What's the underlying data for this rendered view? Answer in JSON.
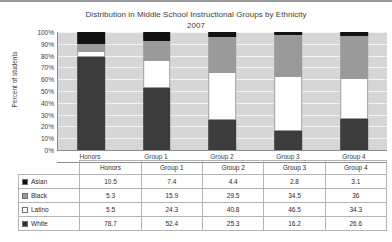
{
  "chart_data": {
    "type": "bar",
    "subtype": "stacked-percent",
    "title": "Distribution in Middle School Instructional Groups by Ethnicity",
    "subtitle": "2007",
    "xlabel": "",
    "ylabel": "Percent of students",
    "ylim": [
      0,
      100
    ],
    "ytick_labels": [
      "100%",
      "90%",
      "80%",
      "70%",
      "60%",
      "50%",
      "40%",
      "30%",
      "20%",
      "10%",
      "0%"
    ],
    "ytick_values": [
      100,
      90,
      80,
      70,
      60,
      50,
      40,
      30,
      20,
      10,
      0
    ],
    "grid": true,
    "legend_position": "table-row-headers",
    "categories": [
      "Honors",
      "Group 1",
      "Group 2",
      "Group 3",
      "Group 4"
    ],
    "stack_order_bottom_to_top": [
      "White",
      "Latino",
      "Black",
      "Asian"
    ],
    "series": [
      {
        "name": "Asian",
        "color": "#121212",
        "values": [
          10.5,
          7.4,
          4.4,
          2.8,
          3.1
        ]
      },
      {
        "name": "Black",
        "color": "#9a9a9a",
        "values": [
          5.3,
          15.9,
          29.5,
          34.5,
          36
        ]
      },
      {
        "name": "Latino",
        "color": "#ffffff",
        "values": [
          5.5,
          24.3,
          40.8,
          46.5,
          34.3
        ]
      },
      {
        "name": "White",
        "color": "#3c3c3c",
        "values": [
          78.7,
          52.4,
          25.3,
          16.2,
          26.6
        ]
      }
    ]
  },
  "table": {
    "corner_label": "",
    "column_headers": [
      "Honors",
      "Group 1",
      "Group 2",
      "Group 3",
      "Group 4"
    ],
    "rows": [
      {
        "label": "Asian",
        "swatch_color": "#121212",
        "values": [
          "10.5",
          "7.4",
          "4.4",
          "2.8",
          "3.1"
        ]
      },
      {
        "label": "Black",
        "swatch_color": "#9a9a9a",
        "values": [
          "5.3",
          "15.9",
          "29.5",
          "34.5",
          "36"
        ]
      },
      {
        "label": "Latino",
        "swatch_color": "#ffffff",
        "values": [
          "5.5",
          "24.3",
          "40.8",
          "46.5",
          "34.3"
        ]
      },
      {
        "label": "White",
        "swatch_color": "#2f2f2f",
        "values": [
          "78.7",
          "52.4",
          "25.3",
          "16.2",
          "26.6"
        ]
      }
    ]
  },
  "colors": {
    "plot_background": "#d6d6d6",
    "gridline": "#f2f2f2",
    "axis_line": "#8d8d8d",
    "text": "#3d3d3d",
    "table_border": "#b4b4b4"
  }
}
